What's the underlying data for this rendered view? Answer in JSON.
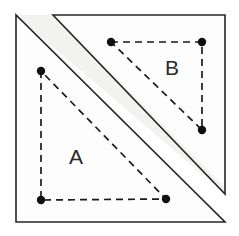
{
  "figure": {
    "canvas": {
      "width": 239,
      "height": 236,
      "background": "#ffffff"
    },
    "colors": {
      "outline": "#262626",
      "dashed": "#1a1a1a",
      "dot": "#101010",
      "label": "#2a2a2a",
      "plain_fill": "#fdfdfd",
      "band_fill": "#f2f2f0"
    },
    "outer_shapes": [
      {
        "name": "lower-left-triangle",
        "points": "16,15 16,222 225,222",
        "fill": "#fdfdfd"
      },
      {
        "name": "upper-right-triangle",
        "points": "53,15 225,15 225,194",
        "fill": "#fdfdfd"
      },
      {
        "name": "overlap-band",
        "points": "53,15 225,187 225,194 16,15",
        "fill": "#f2f2f0"
      }
    ],
    "dashed_triangles": [
      {
        "name": "triangle-a",
        "label": "A",
        "label_x": 76,
        "label_y": 158,
        "points": "41,71 41,200 166,199",
        "vertices": [
          {
            "name": "a-vertex-top-left",
            "x": 41,
            "y": 71
          },
          {
            "name": "a-vertex-bottom-left",
            "x": 41,
            "y": 200
          },
          {
            "name": "a-vertex-bottom-right",
            "x": 166,
            "y": 199
          }
        ]
      },
      {
        "name": "triangle-b",
        "label": "B",
        "label_x": 172,
        "label_y": 69,
        "points": "111,42 202,42 202,130",
        "vertices": [
          {
            "name": "b-vertex-top-left",
            "x": 111,
            "y": 42
          },
          {
            "name": "b-vertex-top-right",
            "x": 202,
            "y": 42
          },
          {
            "name": "b-vertex-bottom-right",
            "x": 202,
            "y": 130
          }
        ]
      }
    ],
    "dot_radius": 4.2
  }
}
